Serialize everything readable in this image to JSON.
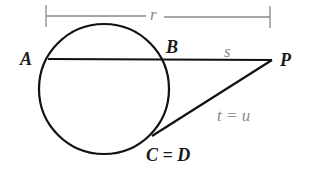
{
  "diagram": {
    "type": "secant-tangent circle theorem",
    "points": {
      "A": "A",
      "B": "B",
      "P": "P",
      "CD": "C = D"
    },
    "segments": {
      "r": "r",
      "s": "s",
      "tu": "t = u"
    },
    "colors": {
      "stroke": "#111111",
      "dimension": "#888888",
      "segment_label": "#8a8a8a"
    }
  }
}
